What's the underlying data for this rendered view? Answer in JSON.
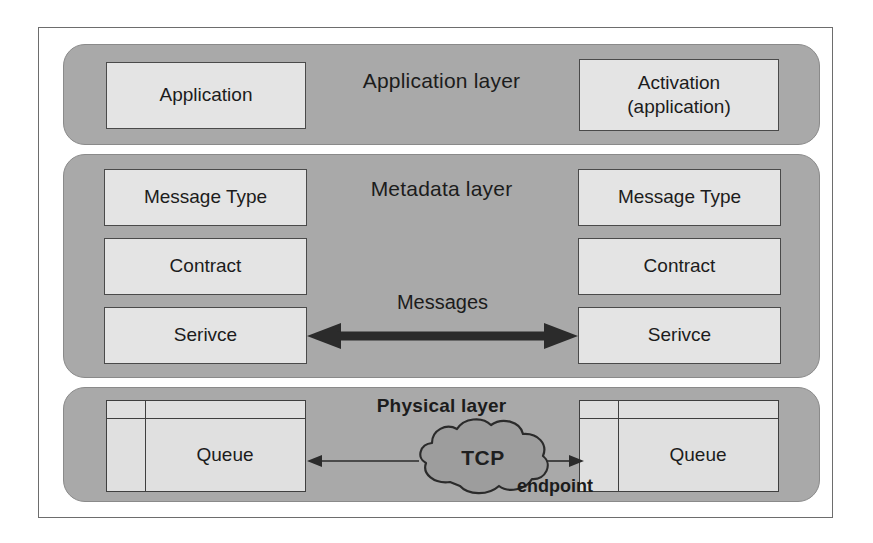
{
  "diagram": {
    "colors": {
      "page_background": "#ffffff",
      "frame_border": "#6d6d6d",
      "layer_panel_fill": "#a9a9a9",
      "node_box_fill": "#e4e4e4",
      "node_box_border": "#4a4a4a",
      "text": "#1c1c1c",
      "arrow": "#2b2b2b"
    },
    "layers": [
      {
        "id": "application",
        "title": "Application layer",
        "title_bold": false,
        "boxes": [
          {
            "id": "application",
            "label": "Application",
            "side": "left"
          },
          {
            "id": "activation",
            "label": "Activation\n(application)",
            "line1": "Activation",
            "line2": "(application)",
            "side": "right"
          }
        ]
      },
      {
        "id": "metadata",
        "title": "Metadata layer",
        "title_bold": false,
        "boxes": [
          {
            "id": "message-type-left",
            "label": "Message Type",
            "side": "left"
          },
          {
            "id": "contract-left",
            "label": "Contract",
            "side": "left"
          },
          {
            "id": "service-left",
            "label": "Serivce",
            "side": "left"
          },
          {
            "id": "message-type-right",
            "label": "Message Type",
            "side": "right"
          },
          {
            "id": "contract-right",
            "label": "Contract",
            "side": "right"
          },
          {
            "id": "service-right",
            "label": "Serivce",
            "side": "right"
          }
        ],
        "connector": {
          "id": "messages",
          "label": "Messages",
          "style": "thick-double-headed-arrow"
        }
      },
      {
        "id": "physical",
        "title": "Physical layer",
        "title_bold": true,
        "boxes": [
          {
            "id": "queue-left",
            "label": "Queue",
            "side": "left"
          },
          {
            "id": "queue-right",
            "label": "Queue",
            "side": "right"
          }
        ],
        "connector": {
          "id": "tcp",
          "label": "TCP",
          "shape": "cloud",
          "endpoint_label": "endpoint",
          "style": "thin-arrow-both-directions"
        }
      }
    ]
  }
}
